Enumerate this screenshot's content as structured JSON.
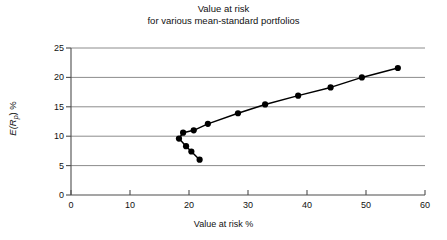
{
  "chart_data": {
    "type": "line",
    "title": "Value at risk\nfor various mean-standard portfolios",
    "title_line1": "Value at risk",
    "title_line2": "for various mean-standard portfolios",
    "xlabel": "Value at risk %",
    "ylabel": "E(Rp) %",
    "ylabel_base": "E(R",
    "ylabel_sub": "p",
    "ylabel_tail": ") %",
    "xlim": [
      0,
      60
    ],
    "ylim": [
      0,
      25
    ],
    "xticks": [
      0,
      10,
      20,
      30,
      40,
      50,
      60
    ],
    "yticks": [
      0,
      5,
      10,
      15,
      20,
      25
    ],
    "xtick_labels": [
      "0",
      "10",
      "20",
      "30",
      "40",
      "50",
      "60"
    ],
    "ytick_labels": [
      "0",
      "5",
      "10",
      "15",
      "20",
      "25"
    ],
    "grid": "horizontal",
    "legend": "none",
    "series": [
      {
        "name": "Efficient frontier (value at risk)",
        "marker": "filled-circle",
        "marker_color": "#000000",
        "line_color": "#000000",
        "x": [
          21.8,
          20.4,
          19.5,
          18.3,
          19.0,
          20.8,
          23.2,
          28.3,
          32.9,
          38.5,
          44.0,
          49.3,
          55.4
        ],
        "y": [
          6.0,
          7.4,
          8.3,
          9.6,
          10.6,
          11.0,
          12.1,
          13.9,
          15.4,
          16.9,
          18.3,
          20.0,
          21.6
        ]
      }
    ]
  },
  "colors": {
    "axis": "#4d4d4d",
    "grid": "#8c8c8c",
    "data": "#000000",
    "text": "#111111",
    "background": "#ffffff"
  }
}
